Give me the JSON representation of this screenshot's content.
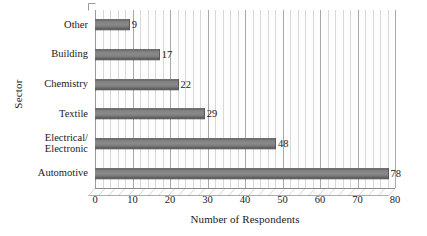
{
  "chart_data": {
    "type": "bar",
    "orientation": "horizontal",
    "title": "",
    "xlabel": "Number of Respondents",
    "ylabel": "Sector",
    "categories": [
      "Automotive",
      "Electrical/\nElectronic",
      "Textile",
      "Chemistry",
      "Building",
      "Other"
    ],
    "values": [
      78,
      48,
      29,
      22,
      17,
      9
    ],
    "data_labels": [
      "78",
      "48",
      "29",
      "22",
      "17",
      "9"
    ],
    "xlim": [
      0,
      80
    ],
    "xticks": [
      0,
      10,
      20,
      30,
      40,
      50,
      60,
      70,
      80
    ],
    "xtick_labels": [
      "0",
      "10",
      "20",
      "30",
      "40",
      "50",
      "60",
      "70",
      "80"
    ],
    "minor_tick_step": 2,
    "grid": "vertical-major-and-minor",
    "legend": "none",
    "style": "3d-clustered-bar",
    "series": [
      {
        "name": "Number of Respondents",
        "values": [
          78,
          48,
          29,
          22,
          17,
          9
        ]
      }
    ],
    "colors": {
      "bar": "#808080",
      "bar_edge": "#5e5e5e",
      "major_gridline": "#a9a9a9",
      "minor_gridline": "#d8d8d8",
      "axis": "#8c8c8c",
      "text": "#1a1a1a",
      "background": "#ffffff"
    }
  }
}
